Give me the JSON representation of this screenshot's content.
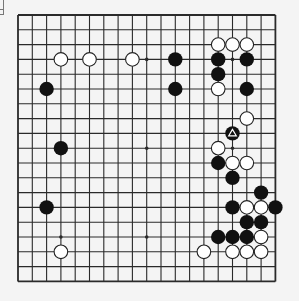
{
  "board": {
    "size": 19,
    "origin": {
      "x": 18,
      "y": 15
    },
    "spacing": {
      "x": 14.3,
      "y": 14.8
    },
    "stone_radius": 7.2,
    "colors": {
      "background": "#f4f4f4",
      "grid_line": "#2a2a2a",
      "black_stone": "#111111",
      "white_stone": "#ffffff",
      "white_stone_outline": "#222222",
      "marker": "#ffffff"
    },
    "star_points": [
      [
        3,
        3
      ],
      [
        9,
        3
      ],
      [
        15,
        3
      ],
      [
        3,
        9
      ],
      [
        9,
        9
      ],
      [
        15,
        9
      ],
      [
        3,
        15
      ],
      [
        9,
        15
      ],
      [
        15,
        15
      ]
    ],
    "black_stones": [
      [
        11,
        3
      ],
      [
        14,
        3
      ],
      [
        16,
        3
      ],
      [
        14,
        4
      ],
      [
        2,
        5
      ],
      [
        11,
        5
      ],
      [
        16,
        5
      ],
      [
        15,
        8
      ],
      [
        3,
        9
      ],
      [
        14,
        10
      ],
      [
        15,
        11
      ],
      [
        17,
        12
      ],
      [
        2,
        13
      ],
      [
        15,
        13
      ],
      [
        18,
        13
      ],
      [
        16,
        14
      ],
      [
        17,
        14
      ],
      [
        14,
        15
      ],
      [
        15,
        15
      ],
      [
        16,
        15
      ]
    ],
    "white_stones": [
      [
        14,
        2
      ],
      [
        15,
        2
      ],
      [
        16,
        2
      ],
      [
        3,
        3
      ],
      [
        5,
        3
      ],
      [
        8,
        3
      ],
      [
        14,
        5
      ],
      [
        16,
        7
      ],
      [
        14,
        9
      ],
      [
        15,
        10
      ],
      [
        16,
        10
      ],
      [
        16,
        13
      ],
      [
        17,
        13
      ],
      [
        17,
        15
      ],
      [
        3,
        16
      ],
      [
        13,
        16
      ],
      [
        15,
        16
      ],
      [
        16,
        16
      ],
      [
        17,
        16
      ]
    ],
    "markers": [
      {
        "type": "triangle",
        "col": 15,
        "row": 8,
        "on": "black"
      }
    ]
  }
}
